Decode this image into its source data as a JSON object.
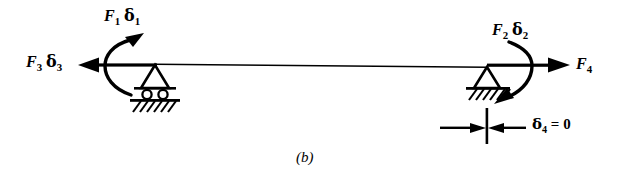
{
  "figure": {
    "caption": "(b)",
    "background_color": "#ffffff",
    "ink_color": "#000000",
    "width": 631,
    "height": 178
  },
  "labels": {
    "f1_d1": {
      "force": "F",
      "force_sub": "1",
      "disp": "δ",
      "disp_sub": "1"
    },
    "f3_d3": {
      "force": "F",
      "force_sub": "3",
      "disp": "δ",
      "disp_sub": "3"
    },
    "f2_d2": {
      "force": "F",
      "force_sub": "2",
      "disp": "δ",
      "disp_sub": "2"
    },
    "f4": {
      "force": "F",
      "force_sub": "4"
    },
    "d4": {
      "symbol": "δ",
      "symbol_sub": "4",
      "operator": "=",
      "value": "0"
    }
  },
  "diagram": {
    "type": "beam-free-body-diagram",
    "beam": {
      "left_x": 155,
      "right_x": 487,
      "y": 65
    },
    "supports": [
      {
        "name": "roller-support",
        "side": "left",
        "x": 155,
        "y": 65,
        "rollers": 2
      },
      {
        "name": "pin-support",
        "side": "right",
        "x": 487,
        "y": 65
      }
    ],
    "arrows": [
      {
        "name": "f3-force-arrow",
        "direction": "left",
        "from_x": 155,
        "to_x": 80,
        "y": 65
      },
      {
        "name": "f1-moment-arrow",
        "direction": "counterclockwise",
        "cx": 133,
        "cy": 65
      },
      {
        "name": "f4-force-arrow",
        "direction": "right",
        "from_x": 487,
        "to_x": 566,
        "y": 65
      },
      {
        "name": "f2-moment-arrow",
        "direction": "clockwise",
        "cx": 516,
        "cy": 65
      }
    ],
    "dimension": {
      "name": "delta4-zero-dimension",
      "tick_x": 487,
      "line_y": 128,
      "left_arrow_from": 440,
      "right_arrow_from": 524
    }
  }
}
